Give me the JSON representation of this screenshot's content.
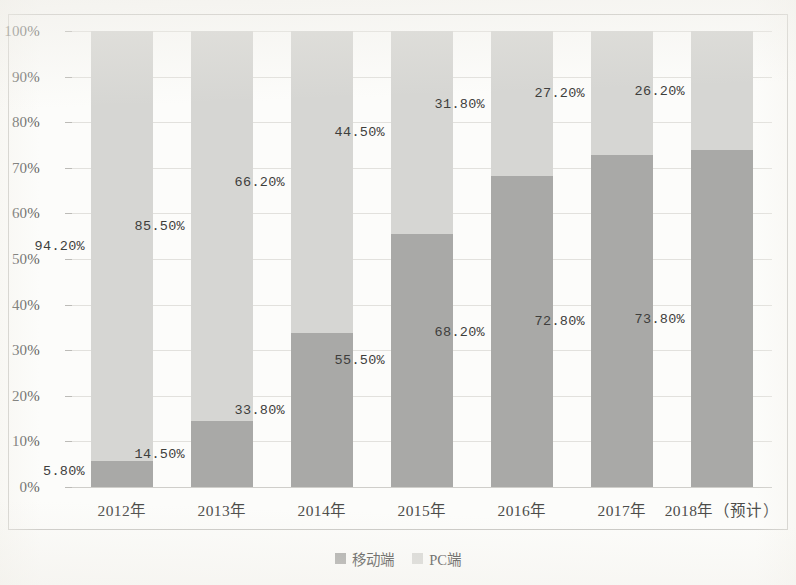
{
  "chart_data": {
    "type": "bar",
    "subtype": "stacked-100-percent",
    "title": "",
    "xlabel": "",
    "ylabel": "",
    "ylim": [
      0,
      100
    ],
    "ytick_labels": [
      "0%",
      "10%",
      "20%",
      "30%",
      "40%",
      "50%",
      "60%",
      "70%",
      "80%",
      "90%",
      "100%"
    ],
    "ytick_values": [
      0,
      10,
      20,
      30,
      40,
      50,
      60,
      70,
      80,
      90,
      100
    ],
    "grid": true,
    "legend_position": "bottom",
    "categories": [
      "2012年",
      "2013年",
      "2014年",
      "2015年",
      "2016年",
      "2017年",
      "2018年（预计）"
    ],
    "series": [
      {
        "name": "移动端",
        "color": "#a9a9a7",
        "values": [
          5.8,
          14.5,
          33.8,
          55.5,
          68.2,
          72.8,
          73.8
        ],
        "labels": [
          "5.80%",
          "14.50%",
          "33.80%",
          "55.50%",
          "68.20%",
          "72.80%",
          "73.80%"
        ]
      },
      {
        "name": "PC端",
        "color": "#d6d6d3",
        "values": [
          94.2,
          85.5,
          66.2,
          44.5,
          31.8,
          27.2,
          26.2
        ],
        "labels": [
          "94.20%",
          "85.50%",
          "66.20%",
          "44.50%",
          "31.80%",
          "27.20%",
          "26.20%"
        ]
      }
    ]
  },
  "legend": {
    "items": [
      {
        "label": "移动端",
        "swatch": "mobile"
      },
      {
        "label": "PC端",
        "swatch": "pc"
      }
    ]
  }
}
